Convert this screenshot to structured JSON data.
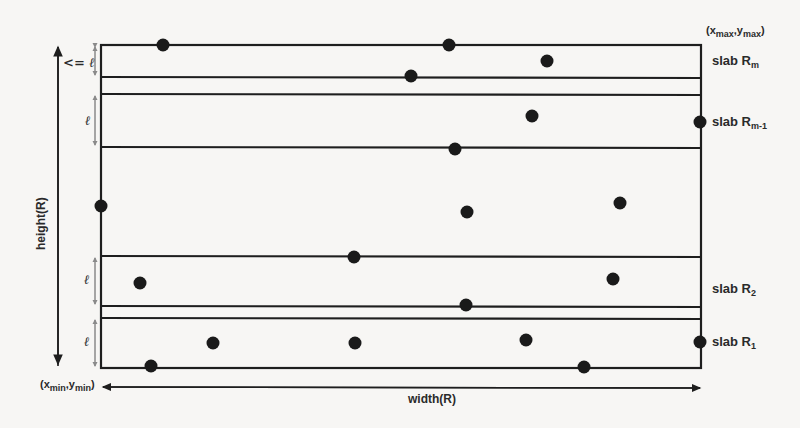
{
  "diagram": {
    "type": "slab-decomposition",
    "corner_max": {
      "prefix": "(x",
      "x_sub": "max",
      "sep": ",y",
      "y_sub": "max",
      "suffix": ")"
    },
    "corner_min": {
      "prefix": "(x",
      "x_sub": "min",
      "sep": ",y",
      "y_sub": "min",
      "suffix": ")"
    },
    "height_label": "height(R)",
    "width_label": "width(R)",
    "slab_labels": [
      {
        "base": "slab R",
        "sub": "m",
        "y": 61
      },
      {
        "base": "slab R",
        "sub": "m-1",
        "y": 122
      },
      {
        "base": "slab R",
        "sub": "2",
        "y": 290
      },
      {
        "base": "slab R",
        "sub": "1",
        "y": 342
      }
    ],
    "dimension_labels": [
      {
        "text": "<= ℓ",
        "y": 63
      },
      {
        "text": "ℓ",
        "y": 120
      },
      {
        "text": "ℓ",
        "y": 280
      },
      {
        "text": "ℓ",
        "y": 342
      }
    ],
    "rectangle": {
      "x1": 101,
      "y1": 45,
      "x2": 701,
      "y2": 368
    },
    "slab_lines_y": [
      77,
      94,
      147,
      256,
      306,
      318
    ],
    "points": [
      [
        163,
        45
      ],
      [
        449,
        45
      ],
      [
        547,
        61
      ],
      [
        411,
        76
      ],
      [
        532,
        116
      ],
      [
        700,
        122
      ],
      [
        455,
        149
      ],
      [
        101,
        206
      ],
      [
        467,
        212
      ],
      [
        620,
        203
      ],
      [
        354,
        257
      ],
      [
        140,
        283
      ],
      [
        613,
        279
      ],
      [
        466,
        305
      ],
      [
        213,
        343
      ],
      [
        355,
        343
      ],
      [
        526,
        340
      ],
      [
        700,
        342
      ],
      [
        151,
        366
      ],
      [
        584,
        367
      ]
    ],
    "colors": {
      "line": "#1e1e1e",
      "point": "#1a1a1a",
      "dim_arrow": "#8a8a8a",
      "background": "#f7f6f4"
    }
  }
}
